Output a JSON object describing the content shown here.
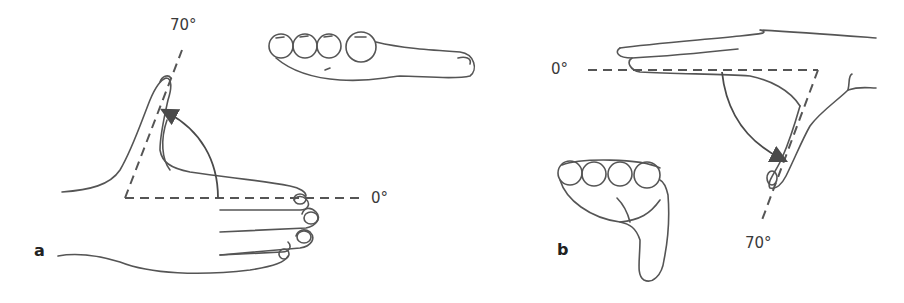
{
  "figure": {
    "panels": [
      {
        "id": "a",
        "label": "a",
        "angle_start_label": "0°",
        "angle_end_label": "70°",
        "description": "Thumb radial abduction from 0° to 70° (dorsal view with side profile inset)"
      },
      {
        "id": "b",
        "label": "b",
        "angle_start_label": "0°",
        "angle_end_label": "70°",
        "description": "Thumb palmar abduction from 0° to 70° (side view with front view inset)"
      }
    ],
    "colors": {
      "ink": "#555555",
      "background": "#ffffff"
    }
  }
}
